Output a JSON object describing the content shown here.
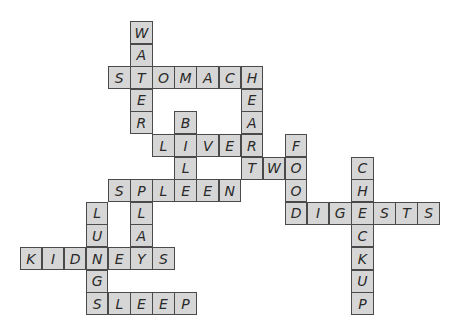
{
  "puzzle": {
    "type": "crossword",
    "colors": {
      "cell_fill": "#d6d6d6",
      "cell_border": "#4a4a4a",
      "letter": "#2a2a2a",
      "background": "#ffffff"
    },
    "grid": {
      "origin_x": 108,
      "origin_y": 21,
      "cell_w": 22.1,
      "cell_h": 22.6
    },
    "words": [
      {
        "word": "WATER",
        "direction": "down",
        "col": 1,
        "row": 0
      },
      {
        "word": "STOMACH",
        "direction": "across",
        "col": 0,
        "row": 2
      },
      {
        "word": "HEART",
        "direction": "down",
        "col": 6,
        "row": 2
      },
      {
        "word": "BILE",
        "direction": "down",
        "col": 3,
        "row": 4
      },
      {
        "word": "LIVER",
        "direction": "across",
        "col": 2,
        "row": 5
      },
      {
        "word": "TWO",
        "direction": "across",
        "col": 6,
        "row": 6
      },
      {
        "word": "FOOD",
        "direction": "down",
        "col": 8,
        "row": 5
      },
      {
        "word": "CHECKUP",
        "direction": "down",
        "col": 11,
        "row": 6
      },
      {
        "word": "SPLEEN",
        "direction": "across",
        "col": 0,
        "row": 7
      },
      {
        "word": "DIGESTS",
        "direction": "across",
        "col": 8,
        "row": 8
      },
      {
        "word": "PLAY",
        "direction": "down",
        "col": 1,
        "row": 7
      },
      {
        "word": "LUNGS",
        "direction": "down",
        "col": -1,
        "row": 8
      },
      {
        "word": "KIDNEYS",
        "direction": "across",
        "col": -4,
        "row": 10
      },
      {
        "word": "SLEEP",
        "direction": "across",
        "col": -1,
        "row": 12
      }
    ]
  }
}
